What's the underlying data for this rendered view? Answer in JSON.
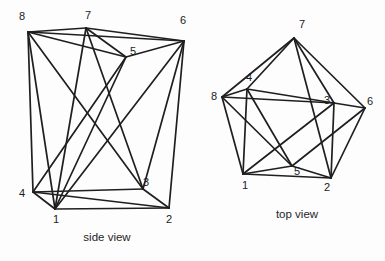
{
  "figure": {
    "title_visible": false,
    "background_color": "#fdfdfd",
    "line_color": "#1f1f1f",
    "label_color": "#1a1a1a"
  },
  "views": [
    {
      "id": "side-view",
      "caption": "side view",
      "caption_pos": [
        107,
        238
      ],
      "vertices": [
        {
          "id": "1",
          "label": "1",
          "point": [
            55,
            209
          ],
          "label_pos": [
            56,
            220
          ]
        },
        {
          "id": "2",
          "label": "2",
          "point": [
            169,
            208
          ],
          "label_pos": [
            169,
            220
          ]
        },
        {
          "id": "3",
          "label": "3",
          "point": [
            143,
            189
          ],
          "label_pos": [
            146,
            183
          ]
        },
        {
          "id": "4",
          "label": "4",
          "point": [
            33,
            192
          ],
          "label_pos": [
            22,
            194
          ]
        },
        {
          "id": "5",
          "label": "5",
          "point": [
            126,
            57
          ],
          "label_pos": [
            133,
            52
          ]
        },
        {
          "id": "6",
          "label": "6",
          "point": [
            184,
            41
          ],
          "label_pos": [
            183,
            21
          ]
        },
        {
          "id": "7",
          "label": "7",
          "point": [
            86,
            28
          ],
          "label_pos": [
            88,
            16
          ]
        },
        {
          "id": "8",
          "label": "8",
          "point": [
            28,
            32
          ],
          "label_pos": [
            22,
            17
          ]
        }
      ],
      "edges": [
        [
          "8",
          "7"
        ],
        [
          "7",
          "6"
        ],
        [
          "8",
          "6"
        ],
        [
          "8",
          "5"
        ],
        [
          "7",
          "5"
        ],
        [
          "6",
          "5"
        ],
        [
          "1",
          "2"
        ],
        [
          "1",
          "4"
        ],
        [
          "4",
          "3"
        ],
        [
          "3",
          "2"
        ],
        [
          "4",
          "2"
        ],
        [
          "8",
          "4"
        ],
        [
          "6",
          "2"
        ],
        [
          "8",
          "1"
        ],
        [
          "8",
          "3"
        ],
        [
          "7",
          "1"
        ],
        [
          "7",
          "3"
        ],
        [
          "5",
          "1"
        ],
        [
          "5",
          "4"
        ],
        [
          "6",
          "3"
        ],
        [
          "6",
          "1"
        ]
      ]
    },
    {
      "id": "top-view",
      "caption": "top view",
      "caption_pos": [
        297,
        215
      ],
      "vertices": [
        {
          "id": "1",
          "label": "1",
          "point": [
            243,
            174
          ],
          "label_pos": [
            245,
            186
          ]
        },
        {
          "id": "2",
          "label": "2",
          "point": [
            331,
            178
          ],
          "label_pos": [
            327,
            188
          ]
        },
        {
          "id": "3",
          "label": "3",
          "point": [
            334,
            103
          ],
          "label_pos": [
            327,
            101
          ]
        },
        {
          "id": "4",
          "label": "4",
          "point": [
            247,
            89
          ],
          "label_pos": [
            249,
            78
          ]
        },
        {
          "id": "5",
          "label": "5",
          "point": [
            292,
            166
          ],
          "label_pos": [
            297,
            172
          ]
        },
        {
          "id": "6",
          "label": "6",
          "point": [
            365,
            108
          ],
          "label_pos": [
            370,
            102
          ]
        },
        {
          "id": "7",
          "label": "7",
          "point": [
            294,
            38
          ],
          "label_pos": [
            302,
            25
          ]
        },
        {
          "id": "8",
          "label": "8",
          "point": [
            222,
            97
          ],
          "label_pos": [
            214,
            97
          ]
        }
      ],
      "edges": [
        [
          "8",
          "7"
        ],
        [
          "7",
          "6"
        ],
        [
          "8",
          "4"
        ],
        [
          "4",
          "7"
        ],
        [
          "7",
          "3"
        ],
        [
          "7",
          "2"
        ],
        [
          "6",
          "2"
        ],
        [
          "6",
          "3"
        ],
        [
          "6",
          "5"
        ],
        [
          "8",
          "1"
        ],
        [
          "1",
          "2"
        ],
        [
          "4",
          "3"
        ],
        [
          "3",
          "2"
        ],
        [
          "1",
          "4"
        ],
        [
          "8",
          "3"
        ],
        [
          "8",
          "5"
        ],
        [
          "1",
          "5"
        ],
        [
          "5",
          "2"
        ],
        [
          "4",
          "5"
        ],
        [
          "1",
          "3"
        ]
      ]
    }
  ]
}
